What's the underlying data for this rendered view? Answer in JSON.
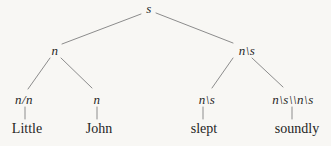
{
  "colors": {
    "background": "#f8f7f4",
    "text": "#262626",
    "line": "#8c8c8c"
  },
  "tree": {
    "nodes": {
      "root": "s",
      "left": "n",
      "right": "n\\s",
      "left_left": "n/n",
      "left_right": "n",
      "right_left": "n\\s",
      "right_right": "n\\s\\\\n\\s"
    },
    "words": [
      "Little",
      "John",
      "slept",
      "soundly"
    ]
  }
}
